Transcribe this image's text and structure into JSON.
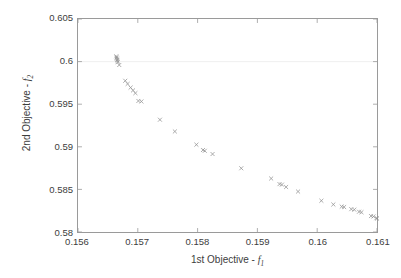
{
  "figure": {
    "background_color": "#ffffff",
    "axis_color": "#9a9a9a",
    "text_color": "#3d3d3d",
    "marker_color": "#8f8f8f",
    "gridline_color": "#e8e8e8"
  },
  "axes": {
    "x_title_prefix": "1st Objective - ",
    "x_title_var": "f",
    "x_title_sub": "1",
    "y_title_prefix": "2nd Objective - ",
    "y_title_var": "f",
    "y_title_sub": "2",
    "x_ticks": [
      "0.156",
      "0.157",
      "0.158",
      "0.159",
      "0.16",
      "0.161"
    ],
    "y_ticks": [
      "0.605",
      "0.6",
      "0.595",
      "0.59",
      "0.585",
      "0.58"
    ]
  },
  "chart_data": {
    "type": "scatter",
    "title": "",
    "xlabel": "1st Objective - f1",
    "ylabel": "2nd Objective - f2",
    "xlim": [
      0.156,
      0.161
    ],
    "ylim": [
      0.58,
      0.605
    ],
    "xticks": [
      0.156,
      0.157,
      0.158,
      0.159,
      0.16,
      0.161
    ],
    "yticks": [
      0.58,
      0.585,
      0.59,
      0.595,
      0.6,
      0.605
    ],
    "grid": true,
    "gridlines_y": [
      0.6
    ],
    "legend": null,
    "marker": "x",
    "marker_size": 4,
    "series": [
      {
        "name": "Pareto front",
        "points": [
          [
            0.15664,
            0.60062
          ],
          [
            0.156645,
            0.60048
          ],
          [
            0.15665,
            0.60035
          ],
          [
            0.156655,
            0.60021
          ],
          [
            0.15666,
            0.60008
          ],
          [
            0.156665,
            0.59994
          ],
          [
            0.15669,
            0.5996
          ],
          [
            0.15679,
            0.59775
          ],
          [
            0.15683,
            0.59738
          ],
          [
            0.15688,
            0.59695
          ],
          [
            0.15692,
            0.59662
          ],
          [
            0.15696,
            0.5963
          ],
          [
            0.15701,
            0.59538
          ],
          [
            0.15706,
            0.59532
          ],
          [
            0.15737,
            0.59318
          ],
          [
            0.15762,
            0.5918
          ],
          [
            0.15798,
            0.59025
          ],
          [
            0.15809,
            0.58962
          ],
          [
            0.15812,
            0.58953
          ],
          [
            0.15825,
            0.58915
          ],
          [
            0.15873,
            0.58748
          ],
          [
            0.15923,
            0.58628
          ],
          [
            0.15937,
            0.58562
          ],
          [
            0.15941,
            0.58556
          ],
          [
            0.15948,
            0.58528
          ],
          [
            0.15968,
            0.58475
          ],
          [
            0.16007,
            0.58367
          ],
          [
            0.16027,
            0.58323
          ],
          [
            0.16041,
            0.58298
          ],
          [
            0.16045,
            0.58293
          ],
          [
            0.16057,
            0.58268
          ],
          [
            0.16062,
            0.58262
          ],
          [
            0.1607,
            0.58238
          ],
          [
            0.16074,
            0.58232
          ],
          [
            0.1609,
            0.58187
          ],
          [
            0.16094,
            0.58182
          ],
          [
            0.16099,
            0.58162
          ],
          [
            0.161,
            0.58158
          ]
        ]
      }
    ]
  }
}
